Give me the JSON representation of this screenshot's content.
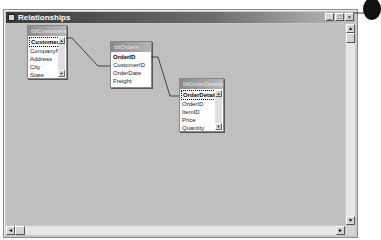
{
  "window": {
    "title": "Relationships",
    "buttons": {
      "minimize": "_",
      "restore": "□",
      "close": "×"
    }
  },
  "tables": [
    {
      "name": "tblCustomers",
      "fields": [
        "CustomerID",
        "CompanyName",
        "Address",
        "City",
        "State"
      ],
      "primary_key": "CustomerID",
      "has_scrollbar": true
    },
    {
      "name": "tblOrders",
      "fields": [
        "OrderID",
        "CustomerID",
        "OrderDate",
        "Freight"
      ],
      "primary_key": "OrderID",
      "has_scrollbar": false
    },
    {
      "name": "tblOrderDetails",
      "fields": [
        "OrderDetailID",
        "OrderID",
        "ItemID",
        "Price",
        "Quantity"
      ],
      "primary_key": "OrderDetailID",
      "has_scrollbar": true
    }
  ],
  "relationships": [
    {
      "from": "tblCustomers.CustomerID",
      "to": "tblOrders.CustomerID"
    },
    {
      "from": "tblOrders.OrderID",
      "to": "tblOrderDetails.OrderID"
    }
  ],
  "scrollbars": {
    "up": "▲",
    "down": "▼",
    "left": "◄",
    "right": "►"
  },
  "callout": {
    "number": ""
  }
}
